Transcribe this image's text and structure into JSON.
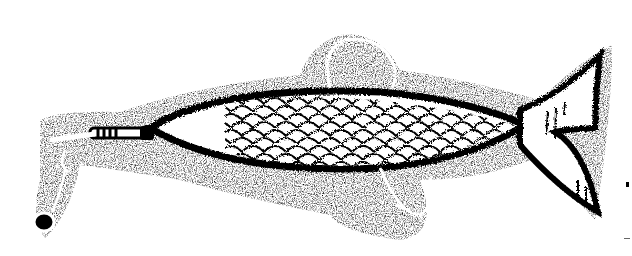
{
  "image": {
    "subject": "fishing lure illustration",
    "style": "black ink stipple drawing",
    "colors": {
      "ink": "#000000",
      "paper": "#ffffff"
    },
    "parts": [
      {
        "name": "body",
        "description": "fish-shaped body with scale pattern"
      },
      {
        "name": "tail",
        "description": "forked tail fin with hatching"
      },
      {
        "name": "upper-hook",
        "description": "curved hook above body"
      },
      {
        "name": "lower-hook",
        "description": "curved hook below body"
      },
      {
        "name": "nose-wrap",
        "description": "wire wrap at nose"
      },
      {
        "name": "swivel",
        "description": "line tie eye and swivel at front"
      }
    ]
  }
}
